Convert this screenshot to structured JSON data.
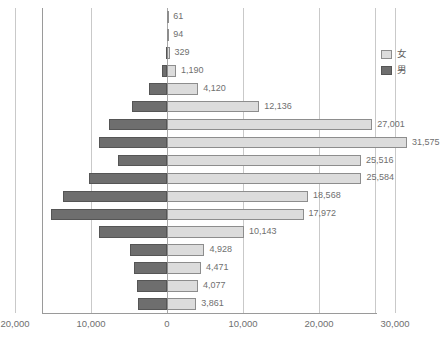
{
  "chart_data": {
    "type": "bar",
    "subtype": "population-pyramid",
    "title": "",
    "xlabel": "",
    "ylabel": "",
    "orientation": "horizontal",
    "grid": true,
    "legend_position": "top-right",
    "xlim": [
      -20000,
      35000
    ],
    "axis_zero_value": "0",
    "xticks": [
      {
        "label": "20,000",
        "value": -20000
      },
      {
        "label": "10,000",
        "value": -10000
      },
      {
        "label": "0",
        "value": 0
      },
      {
        "label": "10,000",
        "value": 10000
      },
      {
        "label": "20,000",
        "value": 20000
      },
      {
        "label": "30,000",
        "value": 30000
      }
    ],
    "categories": [
      "80～",
      "75～79",
      "70～74",
      "65～69",
      "60～64",
      "55～59",
      "50～54",
      "45～49",
      "40～44",
      "35～39",
      "30～34",
      "25～29",
      "20～24",
      "15～19",
      "10～14",
      "5～9",
      "0～4"
    ],
    "series": [
      {
        "name": "男",
        "direction": "left",
        "color": "#6e6e6e",
        "values": [
          0,
          0,
          100,
          700,
          2400,
          4600,
          7600,
          9000,
          6500,
          10200,
          13700,
          15200,
          8900,
          4900,
          4400,
          4000,
          3800
        ]
      },
      {
        "name": "女",
        "direction": "right",
        "color": "#dcdcdc",
        "values": [
          61,
          94,
          329,
          1190,
          4120,
          12136,
          27001,
          31575,
          25516,
          25584,
          18568,
          17972,
          10143,
          4928,
          4471,
          4077,
          3861
        ]
      }
    ],
    "data_labels": [
      "61",
      "94",
      "329",
      "1,190",
      "4,120",
      "12,136",
      "27,001",
      "31,575",
      "25,516",
      "25,584",
      "18,568",
      "17,972",
      "10,143",
      "4,928",
      "4,471",
      "4,077",
      "3,861"
    ]
  },
  "legend": {
    "items": [
      {
        "label": "女",
        "swatch_class": "female"
      },
      {
        "label": "男",
        "swatch_class": "male"
      }
    ]
  },
  "colors": {
    "female_fill": "#dcdcdc",
    "male_fill": "#6e6e6e",
    "gridline": "#c9c9c9",
    "axis": "#9a9a9a",
    "text": "#6f6f6f"
  }
}
